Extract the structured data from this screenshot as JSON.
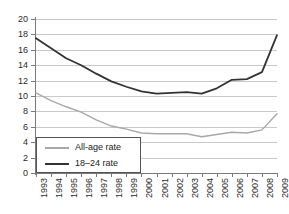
{
  "chart_data": {
    "type": "line",
    "title": "",
    "xlabel": "",
    "ylabel": "",
    "ylim": [
      0,
      20
    ],
    "ytick_step": 2,
    "grid": true,
    "legend_position": "inside-bottom-left",
    "categories": [
      "1993",
      "1994",
      "1995",
      "1996",
      "1997",
      "1998",
      "1999",
      "2000",
      "2001",
      "2002",
      "2003",
      "2004",
      "2005",
      "2006",
      "2007",
      "2008",
      "2009"
    ],
    "yticks": [
      "0",
      "2",
      "4",
      "6",
      "8",
      "10",
      "12",
      "14",
      "16",
      "18",
      "20"
    ],
    "series": [
      {
        "name": "All-age rate",
        "color": "#a8a8a8",
        "values": [
          10.4,
          9.4,
          8.6,
          7.9,
          6.9,
          6.1,
          5.7,
          5.2,
          5.1,
          5.1,
          5.1,
          4.7,
          5.0,
          5.3,
          5.2,
          5.6,
          7.7
        ]
      },
      {
        "name": "18–24 rate",
        "color": "#333333",
        "values": [
          17.5,
          16.2,
          14.9,
          14.0,
          12.9,
          11.9,
          11.2,
          10.6,
          10.3,
          10.4,
          10.5,
          10.3,
          11.0,
          12.1,
          12.2,
          13.1,
          17.9
        ]
      }
    ],
    "legend": [
      {
        "label": "All-age rate",
        "color": "#a8a8a8"
      },
      {
        "label": "18–24 rate",
        "color": "#333333"
      }
    ]
  }
}
